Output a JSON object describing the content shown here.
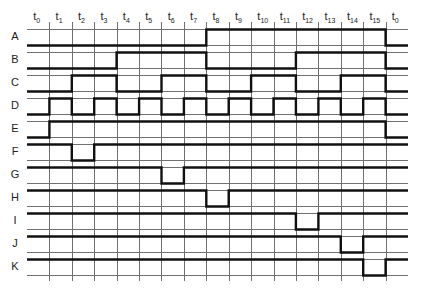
{
  "diagram": {
    "title": "",
    "type": "timing-diagram",
    "time_labels": [
      {
        "base": "t",
        "sub": "0"
      },
      {
        "base": "t",
        "sub": "1"
      },
      {
        "base": "t",
        "sub": "2"
      },
      {
        "base": "t",
        "sub": "3"
      },
      {
        "base": "t",
        "sub": "4"
      },
      {
        "base": "t",
        "sub": "5"
      },
      {
        "base": "t",
        "sub": "6"
      },
      {
        "base": "t",
        "sub": "7"
      },
      {
        "base": "t",
        "sub": "8"
      },
      {
        "base": "t",
        "sub": "9"
      },
      {
        "base": "t",
        "sub": "10"
      },
      {
        "base": "t",
        "sub": "11"
      },
      {
        "base": "t",
        "sub": "12"
      },
      {
        "base": "t",
        "sub": "13"
      },
      {
        "base": "t",
        "sub": "14"
      },
      {
        "base": "t",
        "sub": "15"
      },
      {
        "base": "t",
        "sub": "0"
      }
    ],
    "signals": [
      {
        "name": "A",
        "levels": [
          0,
          0,
          0,
          0,
          0,
          0,
          0,
          0,
          1,
          1,
          1,
          1,
          1,
          1,
          1,
          1,
          0
        ]
      },
      {
        "name": "B",
        "levels": [
          0,
          0,
          0,
          0,
          1,
          1,
          1,
          1,
          0,
          0,
          0,
          0,
          1,
          1,
          1,
          1,
          0
        ]
      },
      {
        "name": "C",
        "levels": [
          0,
          0,
          1,
          1,
          0,
          0,
          1,
          1,
          0,
          0,
          1,
          1,
          0,
          0,
          1,
          1,
          0
        ]
      },
      {
        "name": "D",
        "levels": [
          0,
          1,
          0,
          1,
          0,
          1,
          0,
          1,
          0,
          1,
          0,
          1,
          0,
          1,
          0,
          1,
          0
        ]
      },
      {
        "name": "E",
        "levels": [
          0,
          1,
          1,
          1,
          1,
          1,
          1,
          1,
          1,
          1,
          1,
          1,
          1,
          1,
          1,
          1,
          0
        ]
      },
      {
        "name": "F",
        "levels": [
          1,
          1,
          0,
          1,
          1,
          1,
          1,
          1,
          1,
          1,
          1,
          1,
          1,
          1,
          1,
          1,
          1
        ]
      },
      {
        "name": "G",
        "levels": [
          1,
          1,
          1,
          1,
          1,
          1,
          0,
          1,
          1,
          1,
          1,
          1,
          1,
          1,
          1,
          1,
          1
        ]
      },
      {
        "name": "H",
        "levels": [
          1,
          1,
          1,
          1,
          1,
          1,
          1,
          1,
          0,
          1,
          1,
          1,
          1,
          1,
          1,
          1,
          1
        ]
      },
      {
        "name": "I",
        "levels": [
          1,
          1,
          1,
          1,
          1,
          1,
          1,
          1,
          1,
          1,
          1,
          1,
          0,
          1,
          1,
          1,
          1
        ]
      },
      {
        "name": "J",
        "levels": [
          1,
          1,
          1,
          1,
          1,
          1,
          1,
          1,
          1,
          1,
          1,
          1,
          1,
          1,
          0,
          1,
          1
        ]
      },
      {
        "name": "K",
        "levels": [
          1,
          1,
          1,
          1,
          1,
          1,
          1,
          1,
          1,
          1,
          1,
          1,
          1,
          1,
          1,
          0,
          1
        ]
      }
    ],
    "colors": {
      "signal": "#111111",
      "grid": "#707070",
      "background": "#ffffff"
    }
  }
}
